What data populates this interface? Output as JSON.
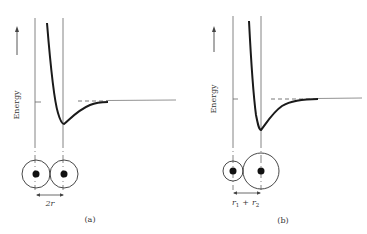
{
  "figure": {
    "panels": [
      {
        "id": "a",
        "caption": "(a)",
        "y_axis_label": "Energy",
        "separation_label": "2r",
        "atoms": "two equal-size atoms"
      },
      {
        "id": "b",
        "caption": "(b)",
        "y_axis_label": "Energy",
        "separation_label_r1": "r",
        "separation_label_sub1": "1",
        "separation_label_plus": "+",
        "separation_label_r2": "r",
        "separation_label_sub2": "2",
        "atoms": "one small and one large atom"
      }
    ],
    "colors": {
      "curve": "#1a1a1a",
      "axis": "#555555",
      "text": "#333333"
    }
  }
}
